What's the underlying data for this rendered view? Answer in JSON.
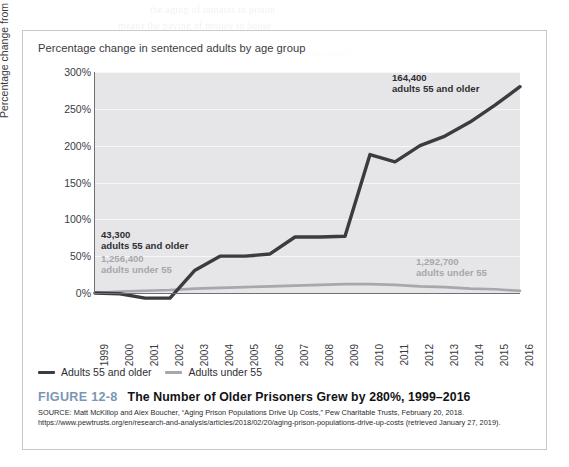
{
  "chart_data": {
    "type": "line",
    "title": "Percentage change in sentenced adults by age group",
    "xlabel": "",
    "ylabel": "Percentage change from 1999",
    "ylim": [
      -15,
      300
    ],
    "ytick_labels": [
      "300%",
      "250%",
      "200%",
      "150%",
      "100%",
      "50%",
      "0%"
    ],
    "ytick_values": [
      300,
      250,
      200,
      150,
      100,
      50,
      0
    ],
    "grid": "horizontal",
    "legend_position": "below-axes-left",
    "x": [
      1999,
      2000,
      2001,
      2002,
      2003,
      2004,
      2005,
      2006,
      2007,
      2008,
      2009,
      2010,
      2011,
      2012,
      2013,
      2014,
      2015,
      2016
    ],
    "categories": [
      "1999",
      "2000",
      "2001",
      "2002",
      "2003",
      "2004",
      "2005",
      "2006",
      "2007",
      "2008",
      "2009",
      "2010",
      "2011",
      "2012",
      "2013",
      "2014",
      "2015",
      "2016"
    ],
    "series": [
      {
        "name": "Adults 55 and older",
        "color": "#3b3b40",
        "values": [
          0,
          -1,
          -7,
          -7,
          31,
          50,
          50,
          53,
          76,
          76,
          77,
          188,
          178,
          200,
          213,
          232,
          255,
          280
        ]
      },
      {
        "name": "Adults under 55",
        "color": "#a7a7ad",
        "values": [
          0,
          2,
          3,
          4,
          6,
          7,
          8,
          9,
          10,
          11,
          12,
          12,
          11,
          9,
          8,
          6,
          5,
          3
        ]
      }
    ],
    "annotations": [
      {
        "text_line1": "43,300",
        "text_line2": "adults 55 and older",
        "style": "dark",
        "series": "Adults 55 and older",
        "anchor": "start"
      },
      {
        "text_line1": "1,256,400",
        "text_line2": "adults under 55",
        "style": "gray",
        "series": "Adults under 55",
        "anchor": "start"
      },
      {
        "text_line1": "164,400",
        "text_line2": "adults 55 and older",
        "style": "dark",
        "series": "Adults 55 and older",
        "anchor": "end"
      },
      {
        "text_line1": "1,292,700",
        "text_line2": "adults under 55",
        "style": "gray",
        "series": "Adults under 55",
        "anchor": "end"
      }
    ]
  },
  "legend": {
    "items": [
      {
        "label": "Adults 55 and older",
        "color": "#3b3b40"
      },
      {
        "label": "Adults under 55",
        "color": "#a7a7ad"
      }
    ]
  },
  "caption": {
    "figure_number": "FIGURE 12-8",
    "title": "The Number of Older Prisoners Grew by 280%, 1999–2016",
    "source": "SOURCE: Matt McKillop and Alex Boucher, “Aging Prison Populations Drive Up Costs,” Pew Charitable Trusts, February 20, 2018. https://www.pewtrusts.org/en/research-and-analysis/articles/2018/02/20/aging-prison-populations-drive-up-costs (retrieved January 27, 2019).",
    "figure_number_color": "#7b96b4"
  },
  "ghost_text": {
    "lines": [
      "the aging of inmates in prison",
      "means the paying of money to house",
      "",
      "mates in US federal prisons are elderly",
      "with comparatively more in the",
      "and 12 are sorted into categories for",
      "g with the issues faced by an aging",
      "that are needed. We can no longer",
      "has an increasingly expensive and one",
      "equalities in this sector"
    ]
  }
}
